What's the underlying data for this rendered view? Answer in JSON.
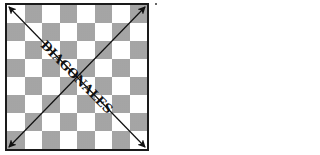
{
  "diagram": {
    "type": "chessboard-diagonals",
    "board": {
      "rows": 8,
      "cols": 8,
      "top_left_square": "light"
    },
    "label": "DIAGONALES",
    "arrows": [
      {
        "name": "diagonal-a",
        "from": "top-left",
        "to": "bottom-right",
        "double_headed": true
      },
      {
        "name": "diagonal-b",
        "from": "bottom-left",
        "to": "top-right",
        "double_headed": true
      }
    ],
    "colors": {
      "light": "#ffffff",
      "dark": "#b8b8b8",
      "line": "#111111"
    }
  }
}
